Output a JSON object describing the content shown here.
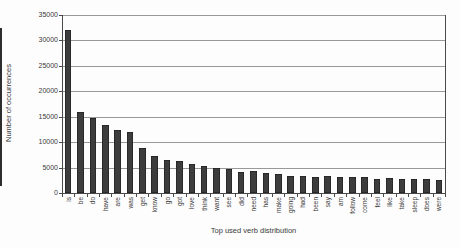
{
  "chart_data": {
    "type": "bar",
    "title": "",
    "xlabel": "Top used verb distribution",
    "ylabel": "Number of occurrences",
    "ylim": [
      0,
      35000
    ],
    "yticks": [
      0,
      5000,
      10000,
      15000,
      20000,
      25000,
      30000,
      35000
    ],
    "ytick_labels": [
      "0",
      "5000",
      "10000",
      "15000",
      "20000",
      "25000",
      "30000",
      "35000"
    ],
    "grid": "horizontal",
    "legend_position": "none",
    "categories": [
      "is",
      "be",
      "do",
      "have",
      "are",
      "was",
      "get",
      "know",
      "go",
      "got",
      "love",
      "think",
      "want",
      "see",
      "did",
      "need",
      "has",
      "make",
      "going",
      "had",
      "been",
      "say",
      "am",
      "follow",
      "come",
      "feel",
      "like",
      "take",
      "sleep",
      "does",
      "were"
    ],
    "values": [
      32000,
      16000,
      14800,
      13400,
      12300,
      12100,
      8900,
      7200,
      6500,
      6400,
      5700,
      5300,
      5000,
      4800,
      4100,
      4300,
      3900,
      3800,
      3400,
      3300,
      3200,
      3300,
      3100,
      3100,
      3200,
      2800,
      2900,
      2800,
      2700,
      2800,
      2600
    ],
    "colors": {
      "bar_fill": "#3d3d3d",
      "bar_edge": "#161616",
      "gridline": "#999999",
      "axis": "#4a4a4a",
      "text": "#3a3a3a",
      "background": "#fdfdfd"
    }
  }
}
